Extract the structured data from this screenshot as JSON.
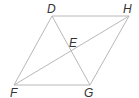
{
  "diagram": {
    "type": "parallelogram-with-diagonals",
    "line_color": "#b8b8b8",
    "label_color": "#333333",
    "points": {
      "D": {
        "label": "D",
        "x": 52,
        "y": 16
      },
      "H": {
        "label": "H",
        "x": 129,
        "y": 16
      },
      "F": {
        "label": "F",
        "x": 14,
        "y": 85
      },
      "G": {
        "label": "G",
        "x": 90,
        "y": 85
      },
      "E": {
        "label": "E",
        "x": 71,
        "y": 50
      }
    },
    "segments": [
      "DH",
      "HG",
      "GF",
      "FD",
      "DG",
      "FH"
    ]
  }
}
